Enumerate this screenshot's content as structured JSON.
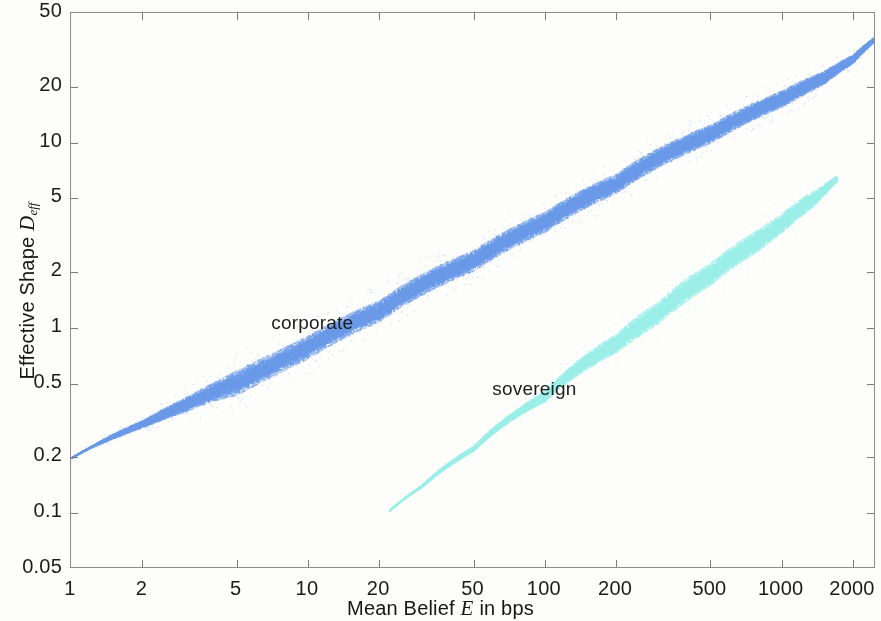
{
  "figure": {
    "width": 881,
    "height": 621,
    "background": "#fdfdfc",
    "axis_color": "#8b8b8b"
  },
  "chart_data": {
    "type": "scatter",
    "title": "",
    "subtitle": "",
    "xlabel": "Mean Belief E in bps",
    "ylabel": "Effective Shape D_eff",
    "xscale": "log",
    "yscale": "log",
    "xlim": [
      1,
      2500
    ],
    "ylim": [
      0.05,
      50
    ],
    "grid": false,
    "legend_position": "inline-annotation",
    "xticks": [
      1,
      2,
      5,
      10,
      20,
      50,
      100,
      200,
      500,
      1000,
      2000
    ],
    "xticklabels": [
      "1",
      "2",
      "5",
      "10",
      "20",
      "50",
      "100",
      "200",
      "500",
      "1000",
      "2000"
    ],
    "yticks": [
      0.05,
      0.1,
      0.2,
      0.5,
      1,
      2,
      5,
      10,
      20,
      50
    ],
    "yticklabels": [
      "0.05",
      "0.1",
      "0.2",
      "0.5",
      "1",
      "2",
      "5",
      "10",
      "20",
      "50"
    ],
    "series": [
      {
        "name": "corporate",
        "color": "#6b9ae8",
        "point_count": 52000,
        "annotation_label": "corporate",
        "annotation_x": 7.0,
        "annotation_y": 1.05,
        "x_range": [
          1.0,
          2500.0
        ],
        "centerline": [
          {
            "x": 1.0,
            "y": 0.2
          },
          {
            "x": 2.0,
            "y": 0.305
          },
          {
            "x": 3.0,
            "y": 0.385
          },
          {
            "x": 5.0,
            "y": 0.51
          },
          {
            "x": 7.0,
            "y": 0.63
          },
          {
            "x": 10.0,
            "y": 0.79
          },
          {
            "x": 20.0,
            "y": 1.24
          },
          {
            "x": 50.0,
            "y": 2.32
          },
          {
            "x": 100.0,
            "y": 3.75
          },
          {
            "x": 200.0,
            "y": 6.05
          },
          {
            "x": 500.0,
            "y": 11.2
          },
          {
            "x": 1000.0,
            "y": 17.3
          },
          {
            "x": 1500.0,
            "y": 22.5
          },
          {
            "x": 2000.0,
            "y": 28.5
          },
          {
            "x": 2500.0,
            "y": 37.0
          }
        ],
        "band_halfwidth_dex": [
          {
            "x": 1.0,
            "w": 0.004
          },
          {
            "x": 2.0,
            "w": 0.02
          },
          {
            "x": 4.0,
            "w": 0.05
          },
          {
            "x": 5.0,
            "w": 0.068
          },
          {
            "x": 8.0,
            "w": 0.062
          },
          {
            "x": 20.0,
            "w": 0.058
          },
          {
            "x": 100.0,
            "w": 0.055
          },
          {
            "x": 500.0,
            "w": 0.05
          },
          {
            "x": 1200.0,
            "w": 0.042
          },
          {
            "x": 1800.0,
            "w": 0.028
          },
          {
            "x": 2500.0,
            "w": 0.012
          }
        ]
      },
      {
        "name": "sovereign",
        "color": "#9cefe8",
        "point_count": 34000,
        "annotation_label": "sovereign",
        "annotation_x": 60.0,
        "annotation_y": 0.46,
        "x_range": [
          22.0,
          1700.0
        ],
        "centerline": [
          {
            "x": 22.0,
            "y": 0.104
          },
          {
            "x": 30.0,
            "y": 0.14
          },
          {
            "x": 50.0,
            "y": 0.225
          },
          {
            "x": 100.0,
            "y": 0.43
          },
          {
            "x": 200.0,
            "y": 0.83
          },
          {
            "x": 300.0,
            "y": 1.21
          },
          {
            "x": 500.0,
            "y": 1.96
          },
          {
            "x": 800.0,
            "y": 3.0
          },
          {
            "x": 1000.0,
            "y": 3.7
          },
          {
            "x": 1400.0,
            "y": 5.15
          },
          {
            "x": 1700.0,
            "y": 6.4
          }
        ],
        "band_halfwidth_dex": [
          {
            "x": 22.0,
            "w": 0.003
          },
          {
            "x": 40.0,
            "w": 0.01
          },
          {
            "x": 80.0,
            "w": 0.022
          },
          {
            "x": 150.0,
            "w": 0.042
          },
          {
            "x": 250.0,
            "w": 0.058
          },
          {
            "x": 400.0,
            "w": 0.062
          },
          {
            "x": 800.0,
            "w": 0.058
          },
          {
            "x": 1300.0,
            "w": 0.045
          },
          {
            "x": 1700.0,
            "w": 0.016
          }
        ]
      }
    ]
  },
  "axes": {
    "x_title_prefix": "Mean Belief ",
    "x_title_var": "E",
    "x_title_suffix": " in bps",
    "y_title_prefix": "Effective Shape ",
    "y_title_var": "D",
    "y_title_sub": "eff"
  }
}
